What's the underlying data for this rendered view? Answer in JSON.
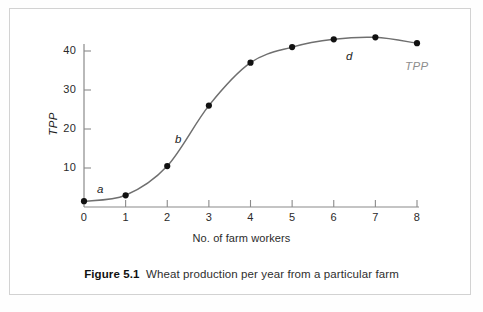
{
  "figure": {
    "caption_label": "Figure 5.1",
    "caption_text": "Wheat production per year from a particular farm"
  },
  "chart_data": {
    "type": "line",
    "title": "",
    "subtitle": "",
    "xlabel": "No. of farm workers",
    "ylabel": "TPP",
    "xlim": [
      0,
      8
    ],
    "ylim": [
      0,
      45
    ],
    "xticks": [
      0,
      1,
      2,
      3,
      4,
      5,
      6,
      7,
      8
    ],
    "xtick_labels": [
      "0",
      "1",
      "2",
      "3",
      "4",
      "5",
      "6",
      "7",
      "8"
    ],
    "yticks": [
      10,
      20,
      30,
      40
    ],
    "ytick_labels": [
      "10",
      "20",
      "30",
      "40"
    ],
    "grid": false,
    "legend": "none",
    "series": [
      {
        "name": "TPP",
        "marker": "filled-circle",
        "line_color": "#6f6f6f",
        "marker_color": "#111111",
        "x": [
          0,
          1,
          2,
          3,
          4,
          5,
          6,
          7,
          8
        ],
        "values": [
          1.5,
          3.0,
          10.5,
          26.0,
          37.0,
          41.0,
          43.0,
          43.5,
          42.0
        ]
      }
    ],
    "annotations": [
      {
        "text": "a",
        "x": 0.45,
        "y": 5.5,
        "style": "italic"
      },
      {
        "text": "b",
        "x": 2.28,
        "y": 17.5,
        "style": "italic"
      },
      {
        "text": "d",
        "x": 6.4,
        "y": 39.0,
        "style": "italic"
      },
      {
        "text": "TPP",
        "x": 7.9,
        "y": 35.5,
        "style": "italic-gray"
      }
    ]
  },
  "colors": {
    "curve": "#6f6f6f",
    "axis": "#8a8a8a",
    "marker": "#111111",
    "frame": "#d2d2d2",
    "text": "#2a2a2a",
    "annotation_gray": "#8d8d8d"
  }
}
